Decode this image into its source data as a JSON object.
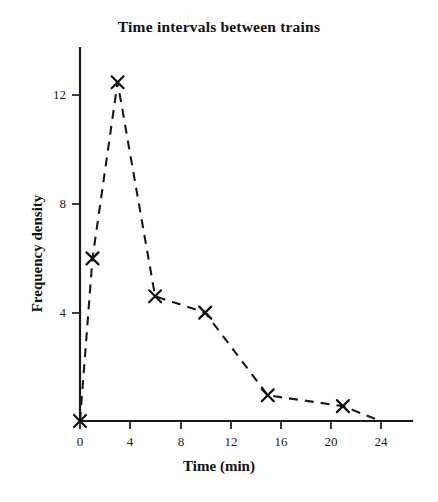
{
  "chart_data": {
    "type": "line",
    "title": "Time intervals between trains",
    "xlabel": "Time (min)",
    "ylabel": "Frequency density",
    "xlim": [
      0,
      26.5
    ],
    "ylim": [
      0,
      13.6
    ],
    "xticks": [
      0,
      4,
      8,
      12,
      16,
      20,
      24
    ],
    "xtick_labels": [
      "0",
      "4",
      "8",
      "12",
      "16",
      "20",
      "24"
    ],
    "yticks": [
      4,
      8,
      12
    ],
    "ytick_labels": [
      "4",
      "8",
      "12"
    ],
    "grid": false,
    "legend": false,
    "line_style": "dashed",
    "marker": "x",
    "color": "#000000",
    "series": [
      {
        "name": "Frequency density",
        "x": [
          0,
          1,
          3,
          6,
          10,
          15,
          21,
          24
        ],
        "values": [
          0,
          6,
          12.5,
          4.6,
          4,
          0.95,
          0.55,
          0
        ]
      }
    ],
    "points": [
      {
        "x": 0,
        "y": 0
      },
      {
        "x": 1,
        "y": 6
      },
      {
        "x": 3,
        "y": 12.5
      },
      {
        "x": 6,
        "y": 4.6
      },
      {
        "x": 10,
        "y": 4
      },
      {
        "x": 15,
        "y": 0.95
      },
      {
        "x": 21,
        "y": 0.55
      },
      {
        "x": 24,
        "y": 0
      }
    ]
  },
  "axes": {
    "x_title": "Time (min)",
    "y_title": "Frequency density"
  }
}
